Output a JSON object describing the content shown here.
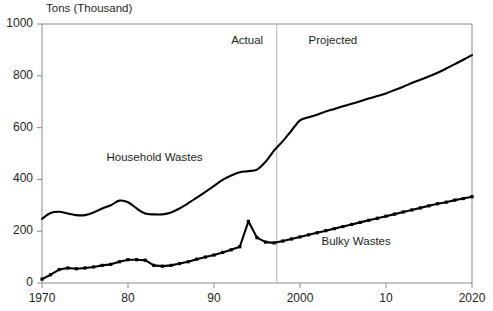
{
  "chart_data": {
    "type": "line",
    "title": "",
    "ylabel": "Tons (Thousand)",
    "xlabel": "",
    "ylim": [
      0,
      1000
    ],
    "xlim": [
      1970,
      2020
    ],
    "yticks": [
      0,
      200,
      400,
      600,
      800,
      1000
    ],
    "ytick_labels": [
      "0",
      "200",
      "400",
      "600",
      "800",
      "1000"
    ],
    "xticks": [
      1970,
      1980,
      1990,
      2000,
      2010,
      2020
    ],
    "xtick_labels": [
      "1970",
      "80",
      "90",
      "2000",
      "10",
      "2020"
    ],
    "grid": false,
    "legend_position": "inline-annotations",
    "annotations": [
      {
        "name": "actual-region-label",
        "text": "Actual",
        "x": 1992,
        "y": 930
      },
      {
        "name": "projected-region-label",
        "text": "Projected",
        "x": 2001,
        "y": 930
      },
      {
        "name": "household-series-label",
        "text": "Household Wastes",
        "x": 1977.5,
        "y": 478
      },
      {
        "name": "bulky-series-label",
        "text": "Bulky Wastes",
        "x": 2002.5,
        "y": 155
      }
    ],
    "divider": {
      "name": "actual-projected-divider",
      "x": 1997.3,
      "label": "Actual / Projected boundary"
    },
    "x": [
      1970,
      1971,
      1972,
      1973,
      1974,
      1975,
      1976,
      1977,
      1978,
      1979,
      1980,
      1981,
      1982,
      1983,
      1984,
      1985,
      1986,
      1987,
      1988,
      1989,
      1990,
      1991,
      1992,
      1993,
      1994,
      1995,
      1996,
      1997,
      1998,
      1999,
      2000,
      2001,
      2002,
      2003,
      2004,
      2005,
      2006,
      2007,
      2008,
      2009,
      2010,
      2011,
      2012,
      2013,
      2014,
      2015,
      2016,
      2017,
      2018,
      2019,
      2020
    ],
    "series": [
      {
        "name": "Household Wastes",
        "markers": false,
        "values": [
          248,
          270,
          275,
          268,
          262,
          262,
          272,
          288,
          300,
          318,
          312,
          288,
          268,
          265,
          265,
          272,
          288,
          308,
          330,
          352,
          375,
          398,
          415,
          428,
          432,
          438,
          468,
          512,
          548,
          588,
          628,
          640,
          650,
          662,
          672,
          682,
          692,
          702,
          712,
          722,
          732,
          745,
          758,
          772,
          785,
          798,
          812,
          828,
          845,
          862,
          880
        ]
      },
      {
        "name": "Bulky Wastes",
        "markers": true,
        "values": [
          15,
          32,
          52,
          58,
          55,
          58,
          62,
          68,
          72,
          82,
          90,
          90,
          88,
          68,
          65,
          68,
          75,
          82,
          92,
          100,
          108,
          118,
          128,
          140,
          238,
          175,
          158,
          155,
          162,
          170,
          178,
          186,
          194,
          202,
          210,
          218,
          226,
          234,
          242,
          250,
          258,
          266,
          274,
          282,
          290,
          298,
          306,
          312,
          320,
          326,
          333
        ]
      }
    ]
  },
  "colors": {
    "axis": "#8a8a8a",
    "line": "#000000",
    "divider": "#b5b5b5",
    "text": "#231f20",
    "background": "#ffffff"
  }
}
